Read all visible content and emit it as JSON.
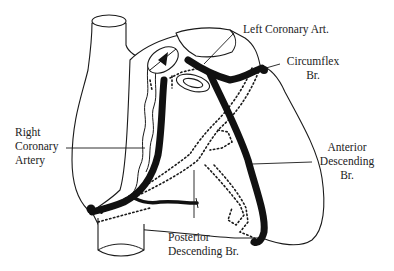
{
  "diagram": {
    "type": "anatomical line drawing",
    "colors": {
      "ink": "#111111",
      "background": "#ffffff"
    }
  },
  "labels": {
    "left_coronary": "Left Coronary Art.",
    "circumflex_line1": "Circumflex",
    "circumflex_line2": "Br.",
    "right_coronary_line1": "Right",
    "right_coronary_line2": "Coronary",
    "right_coronary_line3": "Artery",
    "anterior_line1": "Anterior",
    "anterior_line2": "Descending",
    "anterior_line3": "Br.",
    "posterior_line1": "Posterior",
    "posterior_line2": "Descending  Br."
  }
}
